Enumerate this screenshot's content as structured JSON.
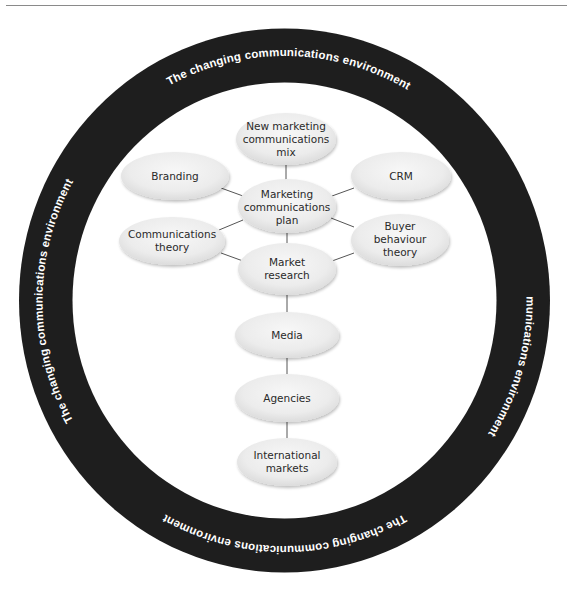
{
  "diagram": {
    "ring": {
      "label": "The changing communications environment",
      "labels": [
        {
          "position": "top",
          "text": "The changing communications environment"
        },
        {
          "position": "right",
          "text": "The changing communications environment"
        },
        {
          "position": "bottom",
          "text": "The changing communications environment"
        },
        {
          "position": "left",
          "text": "The changing communications environment"
        }
      ],
      "color": "#1e1e1e",
      "text_color": "#ffffff"
    },
    "nodes": [
      {
        "id": "new_mix",
        "lines": [
          "New marketing",
          "communications",
          "mix"
        ]
      },
      {
        "id": "branding",
        "lines": [
          "Branding"
        ]
      },
      {
        "id": "crm",
        "lines": [
          "CRM"
        ]
      },
      {
        "id": "plan",
        "lines": [
          "Marketing",
          "communications",
          "plan"
        ]
      },
      {
        "id": "comm_theory",
        "lines": [
          "Communications",
          "theory"
        ]
      },
      {
        "id": "buyer_theory",
        "lines": [
          "Buyer",
          "behaviour",
          "theory"
        ]
      },
      {
        "id": "market_research",
        "lines": [
          "Market",
          "research"
        ]
      },
      {
        "id": "media",
        "lines": [
          "Media"
        ]
      },
      {
        "id": "agencies",
        "lines": [
          "Agencies"
        ]
      },
      {
        "id": "international",
        "lines": [
          "International",
          "markets"
        ]
      }
    ],
    "edges": [
      [
        "new_mix",
        "plan"
      ],
      [
        "branding",
        "plan"
      ],
      [
        "crm",
        "plan"
      ],
      [
        "comm_theory",
        "plan"
      ],
      [
        "buyer_theory",
        "plan"
      ],
      [
        "comm_theory",
        "market_research"
      ],
      [
        "buyer_theory",
        "market_research"
      ],
      [
        "plan",
        "market_research"
      ],
      [
        "market_research",
        "media"
      ],
      [
        "media",
        "agencies"
      ],
      [
        "agencies",
        "international"
      ]
    ],
    "node_color": "#ededed"
  }
}
